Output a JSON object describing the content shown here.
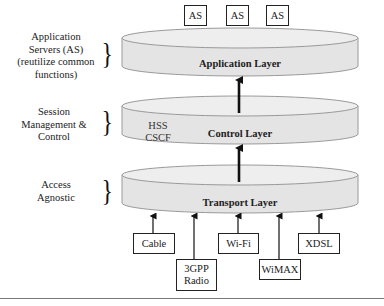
{
  "diagram": {
    "side_labels": [
      {
        "id": "application",
        "text": [
          "Application",
          "Servers (AS)",
          "(reutilize common",
          "functions)"
        ]
      },
      {
        "id": "session",
        "text": [
          "Session",
          "Management &",
          "Control"
        ]
      },
      {
        "id": "access",
        "text": [
          "Access",
          "Agnostic"
        ]
      }
    ],
    "layers": [
      {
        "id": "application",
        "title": "Application Layer"
      },
      {
        "id": "control",
        "title": "Control Layer",
        "nodes": [
          "HSS",
          "CSCF"
        ]
      },
      {
        "id": "transport",
        "title": "Transport Layer"
      }
    ],
    "application_servers": [
      "AS",
      "AS",
      "AS"
    ],
    "access_networks": [
      {
        "id": "cable",
        "label": "Cable"
      },
      {
        "id": "3gpp",
        "label": "3GPP Radio",
        "lines": [
          "3GPP",
          "Radio"
        ]
      },
      {
        "id": "wifi",
        "label": "Wi-Fi"
      },
      {
        "id": "wimax",
        "label": "WiMAX"
      },
      {
        "id": "xdsl",
        "label": "XDSL"
      }
    ],
    "colors": {
      "cylinder_fill": "#e6e6e6",
      "cylinder_top": "#ededed",
      "cylinder_stroke": "#9a9a9a",
      "arrow": "#111111",
      "box_border": "#222222"
    }
  }
}
